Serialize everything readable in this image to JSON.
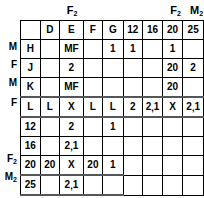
{
  "diagram": {
    "type": "pedigree-genotype-table",
    "column_captions": [
      {
        "label": "F2",
        "base": "F",
        "sub": "2",
        "over_column": "E"
      },
      {
        "label": "F2",
        "base": "F",
        "sub": "2",
        "over_column": "20"
      },
      {
        "label": "M2",
        "base": "M",
        "sub": "2",
        "over_column": "25"
      }
    ],
    "column_headers": [
      "",
      "D",
      "E",
      "F",
      "G",
      "12",
      "16",
      "20",
      "25"
    ],
    "row_labels": [
      {
        "base": "M",
        "sub": ""
      },
      {
        "base": "F",
        "sub": ""
      },
      {
        "base": "M",
        "sub": ""
      },
      {
        "base": "F",
        "sub": ""
      },
      {
        "base": "",
        "sub": ""
      },
      {
        "base": "",
        "sub": ""
      },
      {
        "base": "F",
        "sub": "2"
      },
      {
        "base": "M",
        "sub": "2"
      }
    ],
    "rows": [
      {
        "key": "H",
        "cells": [
          "",
          "MF",
          "",
          "1",
          "1",
          "",
          "1",
          ""
        ]
      },
      {
        "key": "J",
        "cells": [
          "",
          "2",
          "",
          "",
          "",
          "",
          "20",
          "2"
        ]
      },
      {
        "key": "K",
        "cells": [
          "",
          "MF",
          "",
          "",
          "",
          "",
          "20",
          ""
        ]
      },
      {
        "key": "L",
        "cells": [
          "L",
          "X",
          "L",
          "L",
          "2",
          "2,1",
          "X",
          "2,1"
        ]
      },
      {
        "key": "12",
        "cells": [
          "",
          "2",
          "",
          "1",
          null,
          null,
          null,
          null
        ]
      },
      {
        "key": "16",
        "cells": [
          "",
          "2,1",
          "",
          "",
          null,
          null,
          null,
          null
        ]
      },
      {
        "key": "20",
        "cells": [
          "20",
          "X",
          "20",
          "1",
          null,
          null,
          null,
          null
        ]
      },
      {
        "key": "25",
        "cells": [
          "",
          "2,1",
          "",
          "",
          null,
          null,
          null,
          null
        ]
      }
    ]
  }
}
